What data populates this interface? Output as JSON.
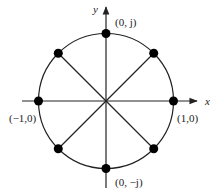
{
  "diagram": {
    "axes": {
      "x_label": "x",
      "y_label": "y"
    },
    "points": [
      {
        "name": "east",
        "angle_deg": 0,
        "label": "(1,0)"
      },
      {
        "name": "north-east",
        "angle_deg": 45,
        "label": ""
      },
      {
        "name": "north",
        "angle_deg": 90,
        "label": "(0, j)"
      },
      {
        "name": "north-west",
        "angle_deg": 135,
        "label": ""
      },
      {
        "name": "west",
        "angle_deg": 180,
        "label": "(−1,0)"
      },
      {
        "name": "south-west",
        "angle_deg": 225,
        "label": ""
      },
      {
        "name": "south",
        "angle_deg": 270,
        "label": "(0, −j)"
      },
      {
        "name": "south-east",
        "angle_deg": 315,
        "label": ""
      }
    ],
    "colors": {
      "line": "#222222",
      "point": "#000000",
      "background": "#ffffff"
    }
  }
}
